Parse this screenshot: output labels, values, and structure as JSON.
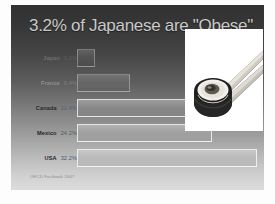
{
  "slide": {
    "title": "3.2% of Japanese are \"Obese\"",
    "source": "OECD Factbook 2007"
  },
  "photo": {
    "alt_name": "sushi-roll-with-chopsticks-photo"
  },
  "chart_data": {
    "type": "bar",
    "orientation": "horizontal",
    "title": "3.2% of Japanese are \"Obese\"",
    "xlabel": "",
    "ylabel": "",
    "categories": [
      "Japan",
      "France",
      "Canada",
      "Mexico",
      "USA"
    ],
    "values": [
      3.2,
      9.4,
      22.4,
      24.2,
      32.2
    ],
    "value_labels": [
      "3.2%",
      "9.4%",
      "22.4%",
      "24.2%",
      "32.2%"
    ],
    "xlim": [
      0,
      32.2
    ],
    "grid": false,
    "legend": false,
    "source": "OECD Factbook 2007",
    "rows": [
      {
        "category": "Japan",
        "value": 3.2,
        "value_label": "3.2%",
        "bar_pct": 9.9,
        "label_color": "#6d6d6d",
        "value_color": "#5e5e5e"
      },
      {
        "category": "France",
        "value": 9.4,
        "value_label": "9.4%",
        "bar_pct": 29.2,
        "label_color": "#8f8f8f",
        "value_color": "#7e7e7e"
      },
      {
        "category": "Canada",
        "value": 22.4,
        "value_label": "22.4%",
        "bar_pct": 69.6,
        "label_color": "#2a2a2a",
        "value_color": "#53646e"
      },
      {
        "category": "Mexico",
        "value": 24.2,
        "value_label": "24.2%",
        "bar_pct": 75.2,
        "label_color": "#262626",
        "value_color": "#4e5e68"
      },
      {
        "category": "USA",
        "value": 32.2,
        "value_label": "32.2%",
        "bar_pct": 100,
        "label_color": "#1f1f1f",
        "value_color": "#49596a"
      }
    ]
  }
}
